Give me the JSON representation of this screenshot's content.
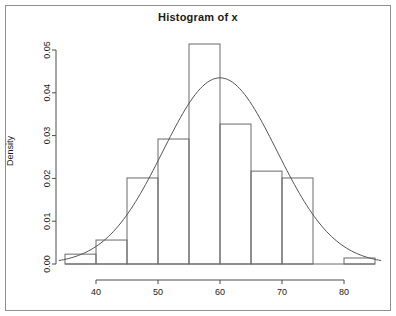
{
  "figure": {
    "title": "Histogram of x",
    "frame_color": "#8f8f8f",
    "axis_color": "#4d4d4d",
    "bar_color": "#6a6a6a",
    "curve_color": "#555555",
    "background": "#ffffff"
  },
  "chart_data": {
    "type": "bar",
    "title": "Histogram of x",
    "xlabel": "",
    "ylabel": "Density",
    "xlim": [
      34,
      86
    ],
    "ylim": [
      0,
      0.052
    ],
    "grid": false,
    "legend": "none",
    "bin_width": 5,
    "bin_edges": [
      35,
      40,
      45,
      50,
      55,
      60,
      65,
      70,
      75,
      80,
      85
    ],
    "categories": [
      "35-40",
      "40-45",
      "45-50",
      "50-55",
      "55-60",
      "60-65",
      "65-70",
      "70-75",
      "75-80",
      "80-85"
    ],
    "values": [
      0.0023,
      0.0056,
      0.0201,
      0.0292,
      0.0514,
      0.0327,
      0.0217,
      0.0201,
      0.0,
      0.0014
    ],
    "xticks": [
      40,
      50,
      60,
      70,
      80
    ],
    "xtick_labels": [
      "40",
      "50",
      "60",
      "70",
      "80"
    ],
    "yticks": [
      0.0,
      0.01,
      0.02,
      0.03,
      0.04,
      0.05
    ],
    "ytick_labels": [
      "0.00",
      "0.01",
      "0.02",
      "0.03",
      "0.04",
      "0.05"
    ],
    "overlay": {
      "name": "normal density curve",
      "type": "line",
      "mean": 60,
      "sd": 9.2,
      "peak_value": 0.0435,
      "peak_x": 60
    }
  }
}
